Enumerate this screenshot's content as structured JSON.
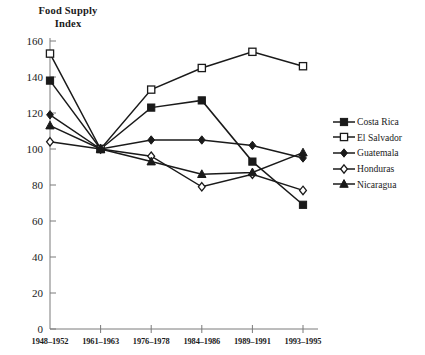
{
  "chart_data": {
    "type": "line",
    "title": "Food Supply\nIndex",
    "xlabel": "",
    "ylabel": "Food Supply Index",
    "categories": [
      "1948–1952",
      "1961–1963",
      "1976–1978",
      "1984–1986",
      "1989–1991",
      "1993–1995"
    ],
    "ylim": [
      0,
      160
    ],
    "yticks": [
      0,
      20,
      40,
      60,
      80,
      100,
      120,
      140,
      160
    ],
    "grid": false,
    "legend_position": "right",
    "series": [
      {
        "name": "Costa Rica",
        "marker": "filled-square",
        "color": "#1a1a1a",
        "values": [
          138,
          100,
          123,
          127,
          93,
          69
        ]
      },
      {
        "name": "El Salvador",
        "marker": "open-square",
        "color": "#1a1a1a",
        "values": [
          153,
          100,
          133,
          145,
          154,
          146
        ]
      },
      {
        "name": "Guatemala",
        "marker": "filled-diamond",
        "color": "#1a1a1a",
        "values": [
          119,
          100,
          105,
          105,
          102,
          95
        ]
      },
      {
        "name": "Honduras",
        "marker": "open-diamond",
        "color": "#1a1a1a",
        "values": [
          104,
          100,
          96,
          79,
          86,
          77
        ]
      },
      {
        "name": "Nicaragua",
        "marker": "filled-triangle",
        "color": "#1a1a1a",
        "values": [
          113,
          100,
          93,
          86,
          87,
          98
        ]
      }
    ]
  },
  "axis": {
    "origin_label": "0"
  }
}
